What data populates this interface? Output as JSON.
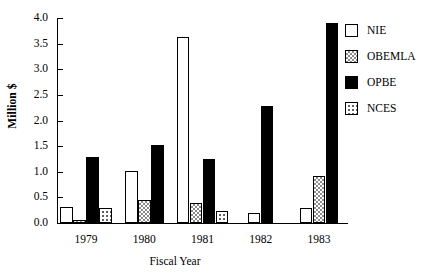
{
  "chart_data": {
    "type": "bar",
    "title": "",
    "subtitle": "",
    "xlabel": "Fiscal Year",
    "ylabel": "Million $",
    "categories": [
      "1979",
      "1980",
      "1981",
      "1982",
      "1983"
    ],
    "ylim": [
      0.0,
      4.0
    ],
    "yticks": [
      "0.0",
      "0.5",
      "1.0",
      "1.5",
      "2.0",
      "2.5",
      "3.0",
      "3.5",
      "4.0"
    ],
    "ytick_values": [
      0.0,
      0.5,
      1.0,
      1.5,
      2.0,
      2.5,
      3.0,
      3.5,
      4.0
    ],
    "grid": false,
    "legend_position": "right",
    "series": [
      {
        "name": "NIE",
        "fill": "white-outline",
        "color": "#ffffff",
        "values": [
          0.32,
          1.02,
          3.62,
          0.2,
          0.3
        ]
      },
      {
        "name": "OBEMLA",
        "fill": "gray-checkered",
        "color": "#8c8c8c",
        "values": [
          0.06,
          0.45,
          0.4,
          null,
          0.92
        ]
      },
      {
        "name": "OPBE",
        "fill": "solid-black",
        "color": "#000000",
        "values": [
          1.28,
          1.53,
          1.25,
          2.28,
          3.9
        ]
      },
      {
        "name": "NCES",
        "fill": "light-dotted",
        "color": "#555555",
        "values": [
          0.29,
          null,
          0.24,
          null,
          null
        ]
      }
    ]
  },
  "legend": {
    "items": [
      {
        "label": "NIE"
      },
      {
        "label": "OBEMLA"
      },
      {
        "label": "OPBE"
      },
      {
        "label": "NCES"
      }
    ]
  }
}
